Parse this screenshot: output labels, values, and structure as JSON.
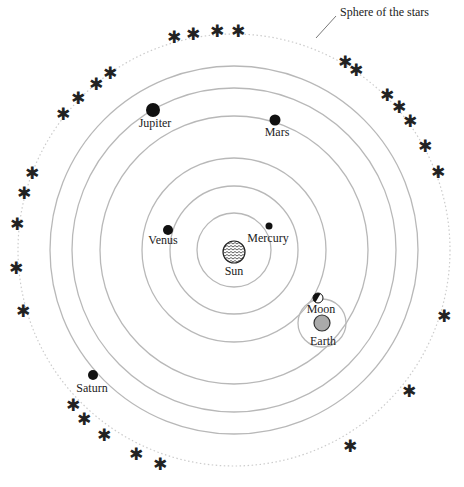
{
  "diagram": {
    "title_label": "Sphere of the stars",
    "center": {
      "x": 234,
      "y": 250
    },
    "colors": {
      "orbit": "#b8b8b8",
      "star_sphere": "#cccccc",
      "planet": "#111111",
      "earth": "#aaaaaa",
      "text": "#222222"
    },
    "sun": {
      "label": "Sun",
      "x": 234,
      "y": 252,
      "r": 11
    },
    "orbits": [
      {
        "name": "Mercury",
        "r": 37
      },
      {
        "name": "Venus",
        "r": 64
      },
      {
        "name": "Earth",
        "r": 92
      },
      {
        "name": "Mars",
        "r": 134
      },
      {
        "name": "Jupiter",
        "r": 162
      },
      {
        "name": "Saturn",
        "r": 184
      }
    ],
    "planets": [
      {
        "name": "Mercury",
        "label": "Mercury",
        "x": 269,
        "y": 226,
        "r": 3.5,
        "lx": 268,
        "ly": 242
      },
      {
        "name": "Venus",
        "label": "Venus",
        "x": 168,
        "y": 230,
        "r": 5,
        "lx": 163,
        "ly": 244
      },
      {
        "name": "Mars",
        "label": "Mars",
        "x": 275,
        "y": 120,
        "r": 5.5,
        "lx": 277,
        "ly": 136
      },
      {
        "name": "Jupiter",
        "label": "Jupiter",
        "x": 153,
        "y": 110,
        "r": 7,
        "lx": 155,
        "ly": 127
      },
      {
        "name": "Saturn",
        "label": "Saturn",
        "x": 93,
        "y": 375,
        "r": 5,
        "lx": 92,
        "ly": 392
      }
    ],
    "earth": {
      "label": "Earth",
      "x": 322,
      "y": 323,
      "r": 8,
      "lx": 323,
      "ly": 345,
      "epicycle_r": 24
    },
    "moon": {
      "label": "Moon",
      "x": 318,
      "y": 298,
      "r": 5,
      "lx": 321,
      "ly": 313
    },
    "star_sphere_r": 216,
    "stars": [
      {
        "x": 174,
        "y": 37
      },
      {
        "x": 193,
        "y": 34
      },
      {
        "x": 217,
        "y": 31
      },
      {
        "x": 238,
        "y": 31
      },
      {
        "x": 345,
        "y": 62
      },
      {
        "x": 356,
        "y": 70
      },
      {
        "x": 387,
        "y": 95
      },
      {
        "x": 399,
        "y": 107
      },
      {
        "x": 410,
        "y": 121
      },
      {
        "x": 425,
        "y": 146
      },
      {
        "x": 438,
        "y": 172
      },
      {
        "x": 110,
        "y": 73
      },
      {
        "x": 96,
        "y": 84
      },
      {
        "x": 78,
        "y": 98
      },
      {
        "x": 63,
        "y": 114
      },
      {
        "x": 32,
        "y": 173
      },
      {
        "x": 24,
        "y": 193
      },
      {
        "x": 17,
        "y": 224
      },
      {
        "x": 16,
        "y": 268
      },
      {
        "x": 23,
        "y": 311
      },
      {
        "x": 444,
        "y": 316
      },
      {
        "x": 409,
        "y": 391
      },
      {
        "x": 350,
        "y": 446
      },
      {
        "x": 73,
        "y": 405
      },
      {
        "x": 84,
        "y": 419
      },
      {
        "x": 104,
        "y": 435
      },
      {
        "x": 136,
        "y": 454
      },
      {
        "x": 160,
        "y": 464
      }
    ],
    "pointer": {
      "x1": 316,
      "y1": 38,
      "x2": 336,
      "y2": 16
    },
    "title_pos": {
      "x": 340,
      "y": 16
    }
  }
}
